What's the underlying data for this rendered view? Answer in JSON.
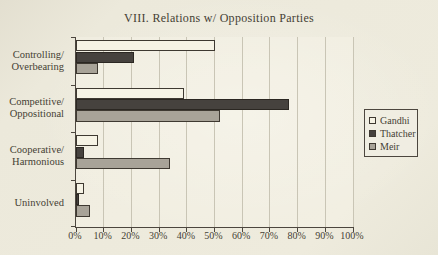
{
  "page": {
    "background_color": "#ece9db",
    "text_color": "#453f34"
  },
  "chart_data": {
    "type": "bar",
    "orientation": "horizontal",
    "title": "VIII. Relations w/ Opposition Parties",
    "categories": [
      "Controlling/Overbearing",
      "Competitive/Oppositional",
      "Cooperative/Harmonious",
      "Uninvolved"
    ],
    "category_label_lines": [
      [
        "Controlling/",
        "Overbearing"
      ],
      [
        "Competitive/",
        "Oppositional"
      ],
      [
        "Cooperative/",
        "Harmonious"
      ],
      [
        "Uninvolved"
      ]
    ],
    "series": [
      {
        "name": "Gandhi",
        "values": [
          50,
          39,
          8,
          3
        ],
        "fill": "#f6f3e5",
        "border": "#3e3931"
      },
      {
        "name": "Thatcher",
        "values": [
          21,
          77,
          3,
          1
        ],
        "fill": "#46423e",
        "border": "#2b2722"
      },
      {
        "name": "Meir",
        "values": [
          8,
          52,
          34,
          5
        ],
        "fill": "#a8a398",
        "border": "#3e3931"
      }
    ],
    "xlabel": "",
    "ylabel": "",
    "x_axis": {
      "min": 0,
      "max": 100,
      "step": 10,
      "tick_labels": [
        "0%",
        "10%",
        "20%",
        "30%",
        "40%",
        "50%",
        "60%",
        "70%",
        "80%",
        "90%",
        "100%"
      ]
    },
    "grid": true,
    "gridline_color": "#c9c5b5",
    "axis_color": "#4c463e",
    "legend": {
      "position": "right",
      "entries": [
        "Gandhi",
        "Thatcher",
        "Meir"
      ]
    }
  }
}
